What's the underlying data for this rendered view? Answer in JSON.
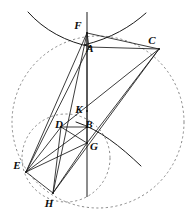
{
  "figure": {
    "width": 194,
    "height": 222,
    "background": "#ffffff",
    "stroke_color": "#1a1a1a",
    "dashed_color": "#7a7a7a"
  },
  "points": [
    {
      "id": "F",
      "label": "F",
      "x": 87,
      "y": 33,
      "label_x": 78,
      "label_y": 25
    },
    {
      "id": "A",
      "label": "A",
      "x": 89,
      "y": 47,
      "label_x": 90,
      "label_y": 48
    },
    {
      "id": "C",
      "label": "C",
      "x": 159,
      "y": 49,
      "label_x": 152,
      "label_y": 40
    },
    {
      "id": "K",
      "label": "K",
      "x": 87,
      "y": 111,
      "label_x": 79,
      "label_y": 109
    },
    {
      "id": "D",
      "label": "D",
      "x": 61,
      "y": 127,
      "label_x": 59,
      "label_y": 124
    },
    {
      "id": "B",
      "label": "B",
      "x": 87,
      "y": 127,
      "label_x": 89,
      "label_y": 124
    },
    {
      "id": "G",
      "label": "G",
      "x": 87,
      "y": 143,
      "label_x": 94,
      "label_y": 146
    },
    {
      "id": "E",
      "label": "E",
      "x": 26,
      "y": 172,
      "label_x": 17,
      "label_y": 165
    },
    {
      "id": "H",
      "label": "H",
      "x": 53,
      "y": 193,
      "label_x": 49,
      "label_y": 203
    }
  ],
  "segments": [
    {
      "name": "F-C",
      "from": "F",
      "to": "C"
    },
    {
      "name": "F-A",
      "from": "F",
      "to": "A"
    },
    {
      "name": "A-C",
      "from": "A",
      "to": "C"
    },
    {
      "name": "F-E",
      "from": "F",
      "to": "E"
    },
    {
      "name": "F-H",
      "from": "F",
      "to": "H"
    },
    {
      "name": "F-G",
      "from": "F",
      "to": "G"
    },
    {
      "name": "A-E",
      "from": "A",
      "to": "E"
    },
    {
      "name": "C-D",
      "from": "C",
      "to": "D"
    },
    {
      "name": "C-G",
      "from": "C",
      "to": "G"
    },
    {
      "name": "C-H",
      "from": "C",
      "to": "H"
    },
    {
      "name": "D-B",
      "from": "D",
      "to": "B"
    },
    {
      "name": "D-G",
      "from": "D",
      "to": "G"
    },
    {
      "name": "D-E",
      "from": "D",
      "to": "E"
    },
    {
      "name": "D-H",
      "from": "D",
      "to": "H"
    },
    {
      "name": "E-G",
      "from": "E",
      "to": "G"
    },
    {
      "name": "E-B",
      "from": "E",
      "to": "B"
    },
    {
      "name": "E-H",
      "from": "E",
      "to": "H"
    },
    {
      "name": "G-H",
      "from": "G",
      "to": "H"
    }
  ],
  "vertical_line": {
    "name": "axis-line",
    "x": 87,
    "y1": 12,
    "y2": 197
  },
  "circles": [
    {
      "name": "large-dashed-circle",
      "cx": 98,
      "cy": 122,
      "r": 86,
      "style": "dashed"
    },
    {
      "name": "small-dashed-circle",
      "cx": 66,
      "cy": 158,
      "r": 44,
      "style": "dashed"
    }
  ],
  "arcs": [
    {
      "name": "upper-left-conic-arc",
      "d": "M 28 12 C 44 30, 66 42, 92 47"
    },
    {
      "name": "upper-right-conic-arc",
      "d": "M 146 13 C 130 27, 112 38, 84 45"
    },
    {
      "name": "lower-right-conic-arc",
      "d": "M 76 122 C 100 130, 120 146, 141 166"
    }
  ]
}
